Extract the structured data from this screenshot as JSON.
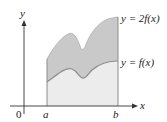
{
  "figure": {
    "axes": {
      "x_label": "x",
      "y_label": "y",
      "origin_label": "0"
    },
    "ticks": {
      "a_label": "a",
      "b_label": "b"
    },
    "curves": {
      "upper_label": "y = 2f(x)",
      "lower_label": "y = f(x)"
    },
    "colors": {
      "upper_band": "#c9c9c9",
      "lower_region": "#ececec",
      "curve_stroke": "#8c8c8c",
      "axis": "#333333"
    }
  }
}
